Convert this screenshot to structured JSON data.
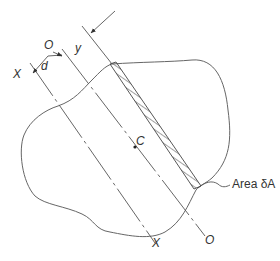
{
  "figure": {
    "type": "second-moment-of-area diagram (parallel axis theorem)",
    "labels": {
      "axis_x_top": "X",
      "axis_x_bottom": "X",
      "axis_o_top": "O",
      "axis_o_bottom": "O",
      "distance_d": "d",
      "distance_y": "y",
      "centroid": "C",
      "area_element": "Area δA"
    },
    "colors": {
      "line": "#555555",
      "outline": "#666666",
      "text": "#333333",
      "background": "#ffffff"
    }
  }
}
